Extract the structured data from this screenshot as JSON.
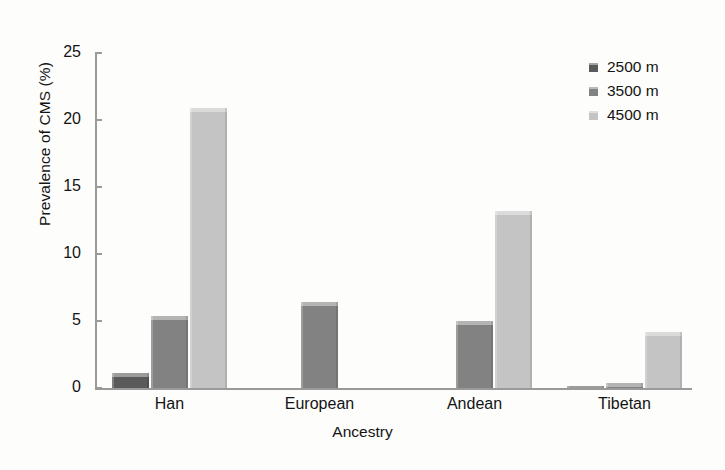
{
  "chart_data": {
    "type": "bar",
    "title": "",
    "xlabel": "Ancestry",
    "ylabel": "Prevalence of CMS (%)",
    "categories": [
      "Han",
      "European",
      "Andean",
      "Tibetan"
    ],
    "ylim": [
      0,
      25
    ],
    "yticks": [
      0,
      5,
      10,
      15,
      20,
      25
    ],
    "ytick_labels": [
      "0",
      "5",
      "10",
      "15",
      "20",
      "25"
    ],
    "grid": false,
    "legend_position": "top-right",
    "series": [
      {
        "name": "2500 m",
        "color": "#5a5a5a",
        "values": [
          1.1,
          null,
          null,
          0.1
        ]
      },
      {
        "name": "3500 m",
        "color": "#828282",
        "values": [
          5.4,
          6.4,
          5.0,
          0.4
        ]
      },
      {
        "name": "4500 m",
        "color": "#c4c4c4",
        "values": [
          20.9,
          null,
          13.2,
          4.2
        ]
      }
    ]
  },
  "axis": {
    "y_title": "Prevalence of CMS (%)",
    "x_title": "Ancestry",
    "y_labels": [
      "25",
      "20",
      "15",
      "10",
      "5",
      "0"
    ],
    "x_labels": [
      "Han",
      "European",
      "Andean",
      "Tibetan"
    ]
  },
  "legend": {
    "items": [
      {
        "label": "2500 m",
        "color": "#5a5a5a"
      },
      {
        "label": "3500 m",
        "color": "#828282"
      },
      {
        "label": "4500 m",
        "color": "#c4c4c4"
      }
    ]
  },
  "colors": {
    "axis": "#9a9a9a",
    "text": "#141414",
    "background": "#fdfdfc",
    "series_2500": "#5a5a5a",
    "series_3500": "#828282",
    "series_4500": "#c4c4c4"
  }
}
